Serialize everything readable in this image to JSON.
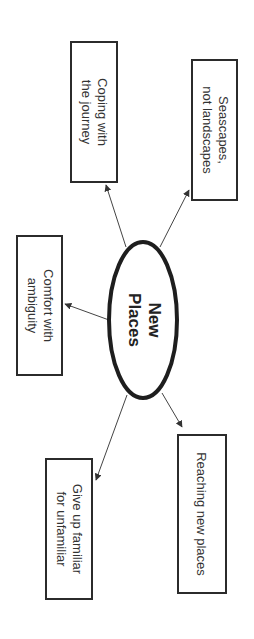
{
  "diagram": {
    "type": "mind-map",
    "orientation": "rotated-90-clockwise",
    "center": {
      "line1": "New",
      "line2": "Places"
    },
    "nodes": [
      {
        "id": "coping",
        "line1": "Coping with",
        "line2": "the journey"
      },
      {
        "id": "seascapes",
        "line1": "Seascapes,",
        "line2": "not landscapes"
      },
      {
        "id": "comfort",
        "line1": "Comfort with",
        "line2": "ambiguity"
      },
      {
        "id": "reaching",
        "line1": "Reaching new places",
        "line2": ""
      },
      {
        "id": "giveup",
        "line1": "Give up familiar",
        "line2": "for unfamiliar"
      }
    ],
    "colors": {
      "stroke": "#2b2b2b",
      "text": "#333333",
      "background": "#ffffff"
    }
  }
}
